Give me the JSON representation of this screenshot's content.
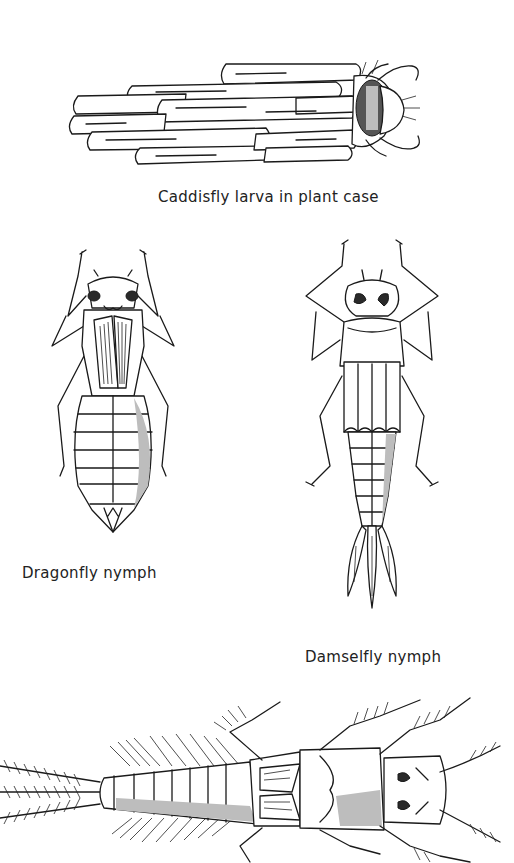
{
  "figures": [
    {
      "id": "caddisfly",
      "caption": "Caddisfly larva in plant case",
      "depicts": "caddisfly larva inside a case made of plant stems"
    },
    {
      "id": "dragonfly",
      "caption": "Dragonfly nymph",
      "depicts": "dragonfly nymph, dorsal view"
    },
    {
      "id": "damselfly",
      "caption": "Damselfly nymph",
      "depicts": "damselfly nymph with three leaf-like caudal gills, dorsal view"
    },
    {
      "id": "stonefly",
      "caption": "",
      "depicts": "stonefly nymph with feathery gills, dorsal view (unlabeled)"
    }
  ],
  "colors": {
    "background": "#ffffff",
    "ink": "#1a1a1a"
  }
}
